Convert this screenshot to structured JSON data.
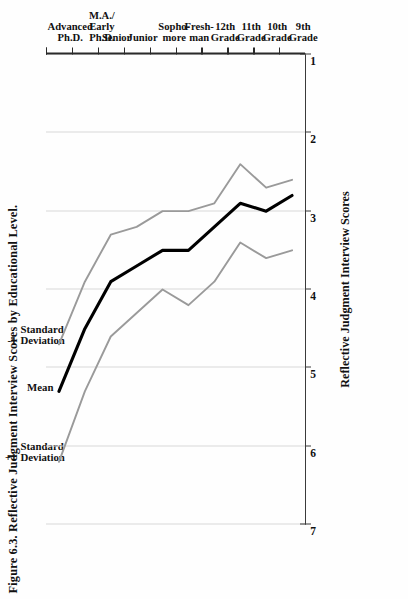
{
  "figure": {
    "title": "Figure 6.3. Reflective Judgment Interview Scores by Educational Level."
  },
  "legend": {
    "position": "above-plot",
    "items": [
      {
        "name": "plus-one-sd",
        "marker": "+1",
        "line1": "Standard",
        "line2": "Deviation",
        "color": "#9a9a9a",
        "value_label": "+1 Standard Deviation"
      },
      {
        "name": "mean",
        "marker": "",
        "line1": "Mean",
        "line2": "",
        "color": "#000000",
        "value_label": "Mean"
      },
      {
        "name": "minus-one-sd",
        "marker": "-1",
        "line1": "Standard",
        "line2": "Deviation",
        "color": "#9a9a9a",
        "value_label": "-1 Standard Deviation"
      }
    ]
  },
  "axes": {
    "score": {
      "label": "Reflective Judgment Interview Scores",
      "ticks": [
        7,
        6,
        5,
        4,
        3,
        2,
        1
      ],
      "min": 1,
      "max": 7,
      "grid": true
    },
    "category": {
      "label": "",
      "ticks": [
        {
          "line1": "9th",
          "line2": "Grade"
        },
        {
          "line1": "10th",
          "line2": "Grade"
        },
        {
          "line1": "11th",
          "line2": "Grade"
        },
        {
          "line1": "12th",
          "line2": "Grade"
        },
        {
          "line1": "Fresh-",
          "line2": "man"
        },
        {
          "line1": "Sopho-",
          "line2": "more"
        },
        {
          "line1": "Junior",
          "line2": ""
        },
        {
          "line1": "Senior",
          "line2": ""
        },
        {
          "line1": "M.A./",
          "line2": "Early",
          "line3": "Ph.D."
        },
        {
          "line1": "Advanced",
          "line2": "Ph.D.",
          "line3": ""
        }
      ]
    },
    "groups": [
      {
        "line1": "High School",
        "line2": "Students",
        "from": 0,
        "to": 3
      },
      {
        "line1": "Traditional-Age",
        "line2": "College Students",
        "from": 4,
        "to": 7
      },
      {
        "line1": "Graduate",
        "line2": "Students",
        "from": 8,
        "to": 9
      }
    ]
  },
  "chart_data": {
    "type": "line",
    "title": "Figure 6.3. Reflective Judgment Interview Scores by Educational Level.",
    "orientation": "rotated-90-categories-vertical",
    "xlabel": "Educational Level",
    "ylabel": "Reflective Judgment Interview Scores",
    "ylim": [
      1,
      7
    ],
    "grid": true,
    "legend_position": "top",
    "categories": [
      "9th Grade",
      "10th Grade",
      "11th Grade",
      "12th Grade",
      "Fresh-man",
      "Sopho-more",
      "Junior",
      "Senior",
      "M.A./Early Ph.D.",
      "Advanced Ph.D."
    ],
    "series": [
      {
        "name": "+1 Standard Deviation",
        "color": "#9a9a9a",
        "values": [
          3.5,
          3.6,
          3.4,
          3.9,
          4.2,
          4.0,
          4.3,
          4.6,
          5.3,
          6.2
        ]
      },
      {
        "name": "Mean",
        "color": "#000000",
        "values": [
          2.8,
          3.0,
          2.9,
          3.2,
          3.5,
          3.5,
          3.7,
          3.9,
          4.5,
          5.3
        ]
      },
      {
        "name": "-1 Standard Deviation",
        "color": "#9a9a9a",
        "values": [
          2.6,
          2.7,
          2.4,
          2.9,
          3.0,
          3.0,
          3.2,
          3.3,
          3.9,
          4.7
        ]
      }
    ]
  }
}
